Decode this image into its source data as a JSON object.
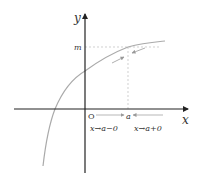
{
  "diagram": {
    "axes": {
      "x_label": "x",
      "y_label": "y",
      "origin_label": "O"
    },
    "markers": {
      "m_label": "m",
      "a_label": "a"
    },
    "limits": {
      "left_limit_label": "x→a−0",
      "right_limit_label": "x→a+0"
    },
    "colors": {
      "axis": "#222222",
      "curve": "#aaaaaa",
      "guide": "#bbbbbb",
      "text": "#333333"
    }
  }
}
